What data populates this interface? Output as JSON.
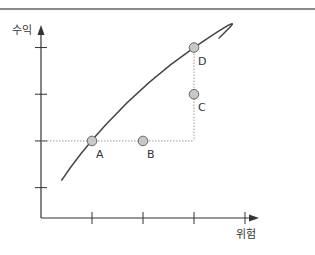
{
  "chart_data": {
    "type": "scatter",
    "title": "",
    "xlabel": "위험",
    "ylabel": "수익",
    "x_ticks": 4,
    "y_ticks": 4,
    "xlim": [
      0,
      4.5
    ],
    "ylim": [
      0,
      4
    ],
    "grid": false,
    "curve": {
      "name": "efficient-frontier",
      "description": "concave increasing curve",
      "points": [
        [
          0.4,
          0.8
        ],
        [
          1,
          1.65
        ],
        [
          2,
          2.65
        ],
        [
          3,
          3.65
        ],
        [
          3.5,
          3.8
        ]
      ]
    },
    "points": [
      {
        "label": "A",
        "x": 1,
        "y": 1.65
      },
      {
        "label": "B",
        "x": 2,
        "y": 1.65
      },
      {
        "label": "C",
        "x": 3,
        "y": 2.65
      },
      {
        "label": "D",
        "x": 3,
        "y": 3.65
      }
    ],
    "guides": [
      {
        "from": "A",
        "to": "B",
        "style": "dotted"
      },
      {
        "from": "C",
        "to": "D",
        "style": "dotted"
      }
    ]
  },
  "colors": {
    "axis": "#333333",
    "curve": "#444444",
    "point_fill": "#c8c8c8",
    "point_stroke": "#666666",
    "guide": "#999999"
  }
}
